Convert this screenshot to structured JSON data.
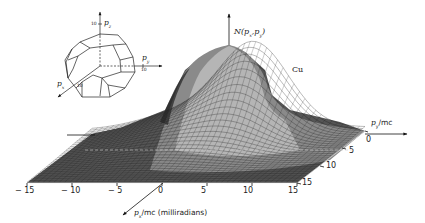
{
  "chart_data": {
    "type": "surface3d",
    "title": "",
    "material_label": "Cu",
    "z_axis_label": "N(px,py)",
    "x_axis_label": "px/mc (milliradians)",
    "y_axis_label": "py/mc",
    "x_ticks": [
      "− 15",
      "− 10",
      "− 5",
      "0",
      "5",
      "10",
      "15"
    ],
    "y_ticks": [
      "0",
      "5",
      "10",
      "15"
    ],
    "x_range": [
      -15,
      15
    ],
    "y_range": [
      0,
      15
    ],
    "peak": {
      "px": 0,
      "py": 0,
      "relative_height": 1.0
    },
    "inset": {
      "type": "brillouin-zone-polyhedron",
      "axes": [
        {
          "name": "pz",
          "tick": "10"
        },
        {
          "name": "py",
          "tick": "10"
        },
        {
          "name": "px",
          "tick": "10"
        }
      ]
    }
  },
  "labels": {
    "z_axis": "N(p",
    "z_axis_sub1": "x",
    "z_axis_mid": ",p",
    "z_axis_sub2": "y",
    "z_axis_end": ")",
    "material": "Cu",
    "py_axis": "p",
    "py_axis_sub": "y",
    "py_axis_unit": "/mc",
    "px_axis": "p",
    "px_axis_sub": "x",
    "px_axis_unit": "/mc (milliradians)",
    "inset_pz": "p",
    "inset_pz_sub": "z",
    "inset_py": "p",
    "inset_py_sub": "y",
    "inset_px": "p",
    "inset_px_sub": "x",
    "inset_tick_z": "10",
    "inset_tick_y": "10",
    "inset_tick_x": "10"
  },
  "x_ticks": [
    "− 15",
    "− 10",
    "− 5",
    "0",
    "5",
    "10",
    "15"
  ],
  "y_ticks": [
    "0",
    "5",
    "10",
    "15"
  ]
}
